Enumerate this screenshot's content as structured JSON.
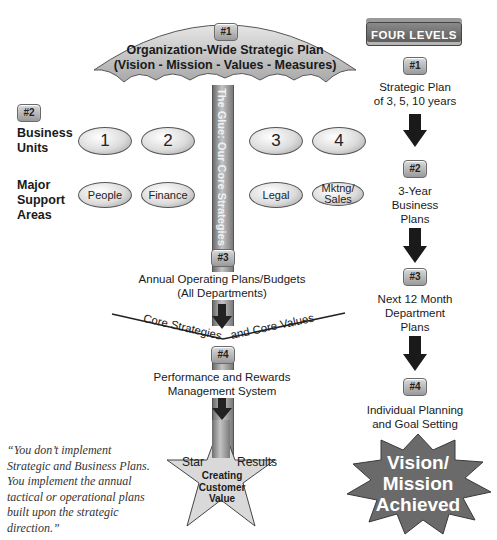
{
  "umbrella": {
    "badge": "#1",
    "title": "Organization-Wide Strategic Plan",
    "subtitle": "(Vision - Mission - Values - Measures)"
  },
  "pole": {
    "text": "The Glue: Our Core Strategies",
    "badge3": "#3",
    "badge4": "#4"
  },
  "left": {
    "badge": "#2",
    "business_units_label": [
      "Business",
      "Units"
    ],
    "support_areas_label": [
      "Major",
      "Support",
      "Areas"
    ],
    "business_units": [
      "1",
      "2",
      "3",
      "4"
    ],
    "support_areas": [
      "People",
      "Finance",
      "Legal",
      "Mktng/ Sales"
    ]
  },
  "flow": {
    "annual_plans": [
      "Annual Operating Plans/Budgets",
      "(All Departments)"
    ],
    "core_left": "Core Strategies",
    "core_right": "and Core Values",
    "performance": [
      "Performance and Rewards",
      "Management System"
    ],
    "star": {
      "left": "Star",
      "right": "Results",
      "center": [
        "Creating",
        "Customer",
        "Value"
      ]
    }
  },
  "quote": {
    "lines": [
      "“You don’t implement",
      "Strategic and Business Plans.",
      "You implement the annual",
      "tactical or operational plans",
      "built upon the strategic",
      "direction.”"
    ]
  },
  "four_levels": {
    "header": "FOUR LEVELS",
    "levels": [
      {
        "badge": "#1",
        "lines": [
          "Strategic Plan",
          "of 3, 5, 10 years"
        ]
      },
      {
        "badge": "#2",
        "lines": [
          "3-Year",
          "Business",
          "Plans"
        ]
      },
      {
        "badge": "#3",
        "lines": [
          "Next 12 Month",
          "Department",
          "Plans"
        ]
      },
      {
        "badge": "#4",
        "lines": [
          "Individual Planning",
          "and Goal Setting"
        ]
      }
    ],
    "burst": [
      "Vision/",
      "Mission",
      "Achieved"
    ]
  },
  "colors": {
    "umbrella_fill": "#c8c8c8",
    "pole": "#9a9a9a",
    "burst_fill": "#6e6e6e",
    "burst_text": "#ffffff",
    "header_fill": "#666666"
  }
}
